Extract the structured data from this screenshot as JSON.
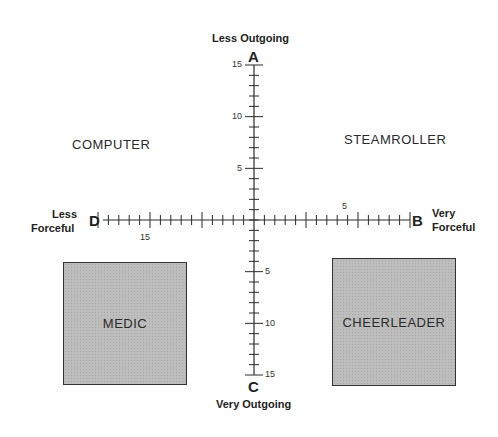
{
  "axes": {
    "top": {
      "letter": "A",
      "title": "Less Outgoing"
    },
    "bottom": {
      "letter": "C",
      "title": "Very Outgoing"
    },
    "left": {
      "letter": "D",
      "title_line1": "Less",
      "title_line2": "Forceful"
    },
    "right": {
      "letter": "B",
      "title_line1": "Very",
      "title_line2": "Forceful"
    },
    "vertical_ticks_upper": [
      "15",
      "10",
      "5"
    ],
    "vertical_ticks_lower": [
      "5",
      "10",
      "15"
    ],
    "horizontal_tick_left": "15",
    "horizontal_tick_right": "5"
  },
  "quadrants": {
    "upper_left": "COMPUTER",
    "upper_right": "STEAMROLLER",
    "lower_left": "MEDIC",
    "lower_right": "CHEERLEADER"
  },
  "colors": {
    "line": "#2a2a2a",
    "box_fill": "#bdbdbd",
    "box_border": "#333333"
  }
}
